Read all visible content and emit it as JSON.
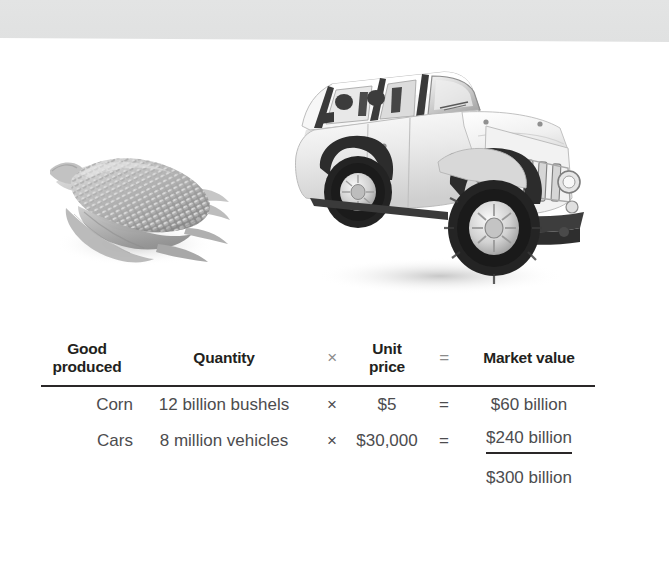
{
  "figure": {
    "images": [
      {
        "name": "corn-photo",
        "alt": "ear of corn with husk, grayscale photo"
      },
      {
        "name": "jeep-photo",
        "alt": "white Jeep Wrangler SUV, grayscale photo"
      }
    ]
  },
  "table": {
    "headers": {
      "good_produced": "Good\nproduced",
      "good_produced_line1": "Good",
      "good_produced_line2": "produced",
      "quantity": "Quantity",
      "multiply_symbol": "×",
      "unit_price_line1": "Unit",
      "unit_price_line2": "price",
      "equals_symbol": "=",
      "market_value": "Market value"
    },
    "rows": [
      {
        "good": "Corn",
        "quantity": "12 billion bushels",
        "multiply": "×",
        "unit_price": "$5",
        "equals": "=",
        "market_value": "$60 billion",
        "underlined": false
      },
      {
        "good": "Cars",
        "quantity": "8 million vehicles",
        "multiply": "×",
        "unit_price": "$30,000",
        "equals": "=",
        "market_value": "$240 billion",
        "underlined": true
      }
    ],
    "total": {
      "good": "",
      "quantity": "",
      "multiply": "",
      "unit_price": "",
      "equals": "",
      "market_value": "$300 billion"
    }
  },
  "colors": {
    "top_band": "#e1e2e2",
    "rule": "#2a2728",
    "header_text": "#231f20",
    "body_text": "#4c4c4e",
    "operator_text": "#8b8b8b",
    "background": "#ffffff"
  }
}
